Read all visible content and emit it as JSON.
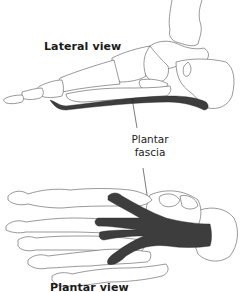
{
  "diagram": {
    "views": [
      {
        "id": "lateral",
        "label": "Lateral view"
      },
      {
        "id": "plantar",
        "label": "Plantar view"
      }
    ],
    "callout": {
      "line1": "Plantar",
      "line2": "fascia"
    },
    "colors": {
      "background": "#ffffff",
      "bone_outline": "#555555",
      "fascia": "#3d3d3d",
      "text": "#1a1a1a"
    }
  }
}
